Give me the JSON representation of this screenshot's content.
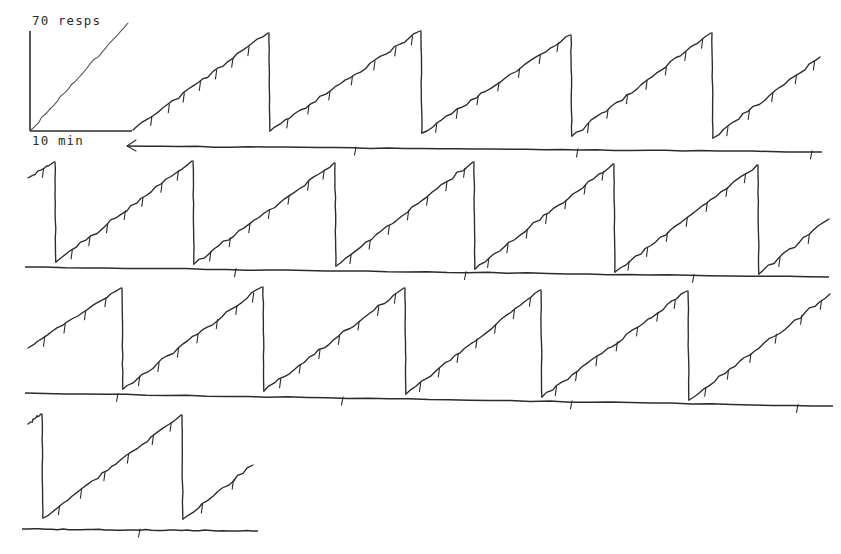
{
  "figure": {
    "kind": "cumulative-response-record",
    "background_color": "#ffffff",
    "ink_color": "#2b2b2b",
    "width": 841,
    "height": 554
  },
  "scale_legend": {
    "vertical_label": "70 resps",
    "horizontal_label": "10 min",
    "origin": {
      "x": 30,
      "y": 131
    },
    "vertical_length_px": 100,
    "horizontal_length_px": 80,
    "diagonal_color": "#555555",
    "diagonal_note": "reference slope line"
  },
  "chart_data": {
    "type": "line",
    "title": "",
    "subtitle": "",
    "xlabel": "10 min",
    "ylabel": "70 resps",
    "grid": false,
    "legend_position": "none",
    "axis_note": "Cumulative responses vs. time; pen resets to baseline after each fixed-interval reinforcement block. Short downward pips on the ramps mark reinforcement deliveries; short downward ticks on the horizontal baselines mark event/time markers.",
    "units": {
      "y_per_100px": 70,
      "x_per_80px": 10,
      "y_unit": "responses",
      "x_unit": "minutes"
    },
    "rows": [
      {
        "index": 1,
        "baseline": {
          "x1": 127,
          "y1": 146,
          "x2": 822,
          "y2": 152
        },
        "baseline_start_arrow": true,
        "baseline_ticks": [
          356,
          578,
          812
        ],
        "segments": [
          {
            "type": "ramp",
            "x1": 133,
            "y1": 130,
            "x2": 268,
            "y2": 33,
            "pips": [
              0.14,
              0.27,
              0.38,
              0.5,
              0.62,
              0.74,
              0.86
            ]
          },
          {
            "type": "reset",
            "x": 269,
            "y_top": 33,
            "y_bottom": 131
          },
          {
            "type": "ramp",
            "x1": 270,
            "y1": 131,
            "x2": 420,
            "y2": 31,
            "pips": [
              0.12,
              0.26,
              0.4,
              0.55,
              0.7,
              0.84,
              0.95
            ]
          },
          {
            "type": "reset",
            "x": 421,
            "y_top": 31,
            "y_bottom": 133
          },
          {
            "type": "ramp",
            "x1": 422,
            "y1": 133,
            "x2": 570,
            "y2": 35,
            "pips": [
              0.1,
              0.24,
              0.38,
              0.52,
              0.66,
              0.8,
              0.92
            ]
          },
          {
            "type": "reset",
            "x": 571,
            "y_top": 35,
            "y_bottom": 136
          },
          {
            "type": "ramp",
            "x1": 572,
            "y1": 136,
            "x2": 711,
            "y2": 33,
            "pips": [
              0.12,
              0.26,
              0.4,
              0.54,
              0.68,
              0.82,
              0.94
            ]
          },
          {
            "type": "reset",
            "x": 712,
            "y_top": 33,
            "y_bottom": 138
          },
          {
            "type": "ramp",
            "x1": 713,
            "y1": 138,
            "x2": 820,
            "y2": 57,
            "pips": [
              0.14,
              0.34,
              0.56,
              0.78,
              0.95
            ]
          }
        ]
      },
      {
        "index": 2,
        "baseline": {
          "x1": 25,
          "y1": 267,
          "x2": 829,
          "y2": 277
        },
        "baseline_start_arrow": false,
        "baseline_ticks": [
          236,
          466,
          694
        ],
        "segments": [
          {
            "type": "ramp",
            "x1": 28,
            "y1": 178,
            "x2": 54,
            "y2": 162,
            "pips": [
              0.6
            ]
          },
          {
            "type": "reset",
            "x": 55,
            "y_top": 162,
            "y_bottom": 262
          },
          {
            "type": "ramp",
            "x1": 56,
            "y1": 262,
            "x2": 192,
            "y2": 161,
            "pips": [
              0.12,
              0.25,
              0.38,
              0.51,
              0.64,
              0.78,
              0.9
            ]
          },
          {
            "type": "reset",
            "x": 193,
            "y_top": 161,
            "y_bottom": 264
          },
          {
            "type": "ramp",
            "x1": 194,
            "y1": 264,
            "x2": 334,
            "y2": 163,
            "pips": [
              0.12,
              0.26,
              0.4,
              0.54,
              0.68,
              0.82,
              0.93
            ]
          },
          {
            "type": "reset",
            "x": 335,
            "y_top": 163,
            "y_bottom": 266
          },
          {
            "type": "ramp",
            "x1": 336,
            "y1": 266,
            "x2": 473,
            "y2": 162,
            "pips": [
              0.11,
              0.25,
              0.39,
              0.53,
              0.67,
              0.81,
              0.94
            ]
          },
          {
            "type": "reset",
            "x": 474,
            "y_top": 162,
            "y_bottom": 269
          },
          {
            "type": "ramp",
            "x1": 475,
            "y1": 269,
            "x2": 613,
            "y2": 164,
            "pips": [
              0.1,
              0.24,
              0.38,
              0.52,
              0.66,
              0.8,
              0.93
            ]
          },
          {
            "type": "reset",
            "x": 614,
            "y_top": 164,
            "y_bottom": 272
          },
          {
            "type": "ramp",
            "x1": 615,
            "y1": 272,
            "x2": 757,
            "y2": 165,
            "pips": [
              0.1,
              0.23,
              0.37,
              0.51,
              0.65,
              0.79,
              0.92
            ]
          },
          {
            "type": "reset",
            "x": 758,
            "y_top": 165,
            "y_bottom": 274
          },
          {
            "type": "ramp",
            "x1": 759,
            "y1": 274,
            "x2": 829,
            "y2": 219,
            "pips": [
              0.3,
              0.72
            ]
          }
        ]
      },
      {
        "index": 3,
        "baseline": {
          "x1": 25,
          "y1": 393,
          "x2": 833,
          "y2": 406
        },
        "baseline_start_arrow": false,
        "baseline_ticks": [
          118,
          343,
          572,
          798
        ],
        "segments": [
          {
            "type": "ramp",
            "x1": 28,
            "y1": 348,
            "x2": 121,
            "y2": 288,
            "pips": [
              0.18,
              0.4,
              0.62,
              0.84
            ]
          },
          {
            "type": "reset",
            "x": 122,
            "y_top": 288,
            "y_bottom": 389
          },
          {
            "type": "ramp",
            "x1": 123,
            "y1": 389,
            "x2": 262,
            "y2": 287,
            "pips": [
              0.12,
              0.26,
              0.4,
              0.54,
              0.68,
              0.82,
              0.94
            ]
          },
          {
            "type": "reset",
            "x": 263,
            "y_top": 287,
            "y_bottom": 391
          },
          {
            "type": "ramp",
            "x1": 264,
            "y1": 391,
            "x2": 404,
            "y2": 288,
            "pips": [
              0.12,
              0.26,
              0.4,
              0.54,
              0.68,
              0.82,
              0.94
            ]
          },
          {
            "type": "reset",
            "x": 405,
            "y_top": 288,
            "y_bottom": 394
          },
          {
            "type": "ramp",
            "x1": 406,
            "y1": 394,
            "x2": 540,
            "y2": 290,
            "pips": [
              0.11,
              0.25,
              0.39,
              0.53,
              0.67,
              0.81,
              0.93
            ]
          },
          {
            "type": "reset",
            "x": 541,
            "y_top": 290,
            "y_bottom": 397
          },
          {
            "type": "ramp",
            "x1": 542,
            "y1": 397,
            "x2": 687,
            "y2": 291,
            "pips": [
              0.1,
              0.24,
              0.38,
              0.52,
              0.66,
              0.8,
              0.92
            ]
          },
          {
            "type": "reset",
            "x": 688,
            "y_top": 291,
            "y_bottom": 400
          },
          {
            "type": "ramp",
            "x1": 689,
            "y1": 400,
            "x2": 830,
            "y2": 294,
            "pips": [
              0.12,
              0.28,
              0.44,
              0.62,
              0.8,
              0.94
            ]
          }
        ]
      },
      {
        "index": 4,
        "baseline": {
          "x1": 22,
          "y1": 529,
          "x2": 258,
          "y2": 531
        },
        "baseline_start_arrow": false,
        "baseline_ticks": [
          140
        ],
        "segments": [
          {
            "type": "ramp",
            "x1": 28,
            "y1": 424,
            "x2": 41,
            "y2": 414,
            "pips": []
          },
          {
            "type": "reset",
            "x": 42,
            "y_top": 414,
            "y_bottom": 518
          },
          {
            "type": "ramp",
            "x1": 43,
            "y1": 518,
            "x2": 181,
            "y2": 415,
            "pips": [
              0.12,
              0.28,
              0.45,
              0.62,
              0.8,
              0.93
            ]
          },
          {
            "type": "reset",
            "x": 182,
            "y_top": 415,
            "y_bottom": 519
          },
          {
            "type": "ramp",
            "x1": 183,
            "y1": 519,
            "x2": 253,
            "y2": 465,
            "pips": [
              0.28,
              0.72
            ]
          }
        ]
      }
    ],
    "summary": {
      "rows_count": 4,
      "total_resets": 18,
      "pattern": "fixed-interval scallop / steady-rate ramps with pen resets",
      "ramp_rate_resps_per_min": 9
    }
  }
}
